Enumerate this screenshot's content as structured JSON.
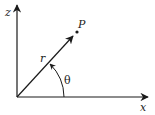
{
  "diagram": {
    "type": "polar-coordinate-diagram",
    "labels": {
      "vertical_axis": "z",
      "horizontal_axis": "x",
      "point": "P",
      "radius": "r",
      "angle": "θ"
    },
    "colors": {
      "line": "#1a1a1a",
      "background": "#ffffff"
    }
  }
}
